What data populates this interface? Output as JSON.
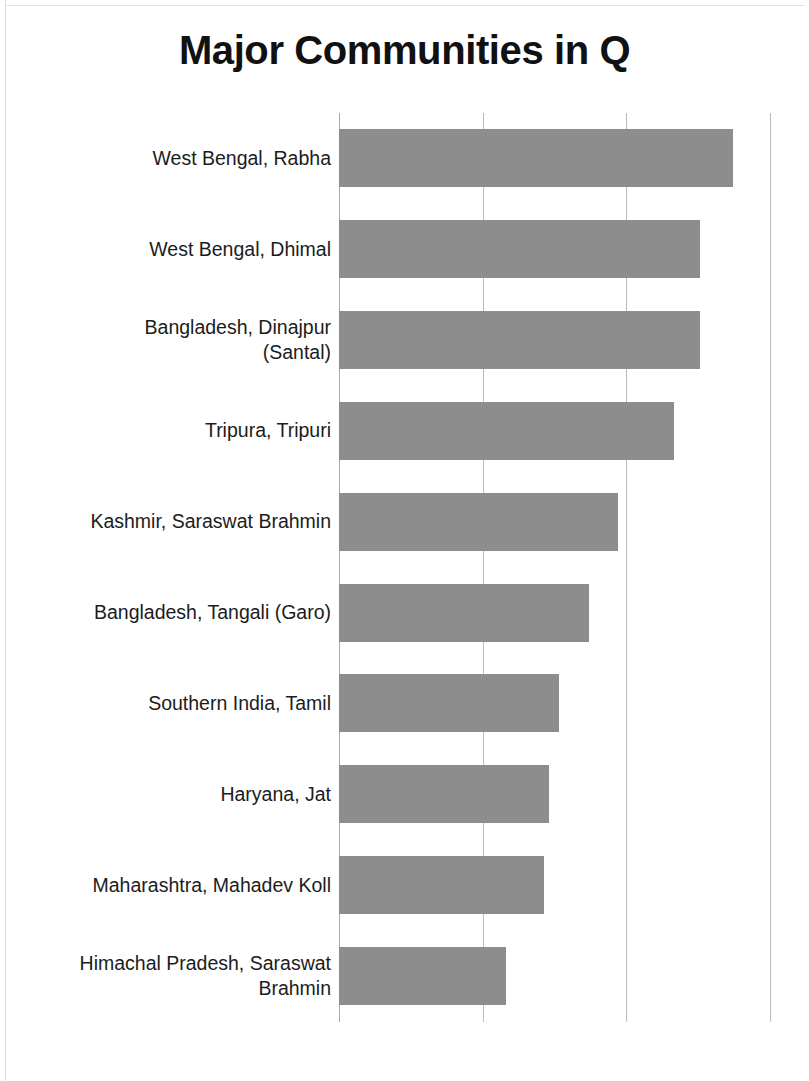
{
  "chart_data": {
    "type": "bar",
    "orientation": "horizontal",
    "title": "Major Communities in Q",
    "xlabel": "",
    "ylabel": "",
    "grid": true,
    "gridlines_x": [
      0,
      1,
      2,
      3
    ],
    "legend": null,
    "xlim": [
      0,
      3
    ],
    "axis_ticks_visible": false,
    "bar_color": "#8d8d8d",
    "gridline_color": "#bcbcbc",
    "categories": [
      "West Bengal, Rabha",
      "West Bengal, Dhimal",
      "Bangladesh, Dinajpur (Santal)",
      "Tripura, Tripuri",
      "Kashmir, Saraswat Brahmin",
      "Bangladesh, Tangali (Garo)",
      "Southern India, Tamil",
      "Haryana, Jat",
      "Maharashtra, Mahadev Koll",
      "Himachal Pradesh, Saraswat Brahmin"
    ],
    "values": [
      2.74,
      2.51,
      2.51,
      2.33,
      1.94,
      1.74,
      1.53,
      1.46,
      1.43,
      1.16
    ]
  },
  "labels": [
    {
      "lines": [
        "West Bengal, Rabha"
      ]
    },
    {
      "lines": [
        "West Bengal, Dhimal"
      ]
    },
    {
      "lines": [
        "Bangladesh, Dinajpur",
        "(Santal)"
      ]
    },
    {
      "lines": [
        "Tripura, Tripuri"
      ]
    },
    {
      "lines": [
        "Kashmir, Saraswat Brahmin"
      ]
    },
    {
      "lines": [
        "Bangladesh, Tangali (Garo)"
      ]
    },
    {
      "lines": [
        "Southern India, Tamil"
      ]
    },
    {
      "lines": [
        "Haryana, Jat"
      ]
    },
    {
      "lines": [
        "Maharashtra, Mahadev Koll"
      ]
    },
    {
      "lines": [
        "Himachal Pradesh, Saraswat",
        "Brahmin"
      ]
    }
  ]
}
